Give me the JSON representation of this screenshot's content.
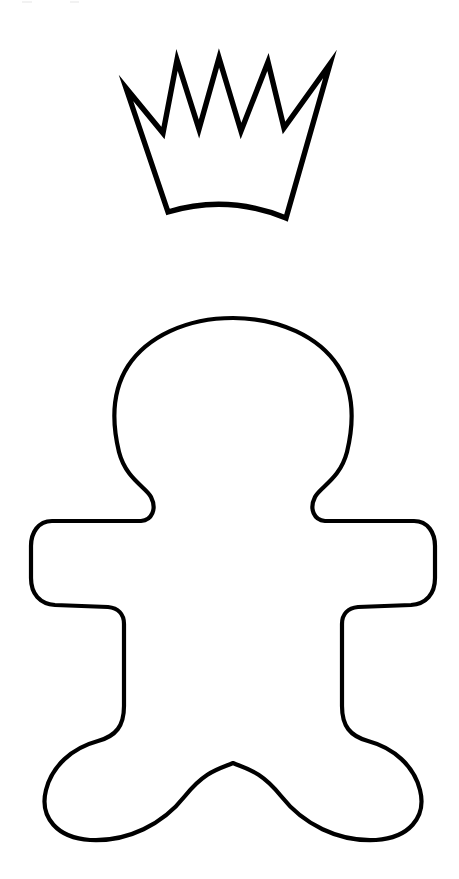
{
  "page": {
    "background_color": "#ffffff",
    "ink_color": "#000000",
    "width": 459,
    "height": 879
  },
  "artwork": {
    "crown": {
      "name": "crown",
      "label": "Crown outline",
      "point_count": 5,
      "stroke_width": 5.4,
      "bounds": {
        "x": 125,
        "y": 58,
        "width": 206,
        "height": 162
      },
      "peaks": [
        {
          "x": 126,
          "y": 88
        },
        {
          "x": 177,
          "y": 60
        },
        {
          "x": 219,
          "y": 58
        },
        {
          "x": 268,
          "y": 62
        },
        {
          "x": 330,
          "y": 64
        }
      ],
      "valleys": [
        {
          "x": 163,
          "y": 133
        },
        {
          "x": 199,
          "y": 129
        },
        {
          "x": 241,
          "y": 131
        },
        {
          "x": 284,
          "y": 128
        }
      ],
      "base_left": {
        "x": 168,
        "y": 212
      },
      "base_right": {
        "x": 286,
        "y": 218
      },
      "base_curve_dip": {
        "x": 227,
        "y": 205
      },
      "path": "M 126 88 L 163 133 L 177 60 L 199 129 L 219 58 L 241 131 L 268 62 L 284 128 L 330 64 L 286 218 Q 227 194 168 212 Z"
    },
    "gingerbread_man": {
      "name": "gingerbread-man",
      "label": "Gingerbread man outline",
      "stroke_width": 4.2,
      "bounds": {
        "x": 31,
        "y": 318,
        "width": 405,
        "height": 524
      },
      "parts": [
        {
          "name": "head",
          "top_y": 320,
          "left_x": 115,
          "right_x": 352,
          "center_x": 233
        },
        {
          "name": "neck-left",
          "x": 150,
          "y": 487
        },
        {
          "name": "neck-right",
          "x": 317,
          "y": 487
        },
        {
          "name": "left-arm",
          "tip_x": 31,
          "top_y": 522,
          "bottom_y": 602
        },
        {
          "name": "right-arm",
          "tip_x": 435,
          "top_y": 522,
          "bottom_y": 602
        },
        {
          "name": "left-armpit",
          "x": 124,
          "y": 609
        },
        {
          "name": "right-armpit",
          "x": 343,
          "y": 609
        },
        {
          "name": "crotch",
          "x": 233,
          "y": 763
        },
        {
          "name": "left-foot",
          "left_x": 45,
          "right_x": 178,
          "bottom_y": 841
        },
        {
          "name": "right-foot",
          "left_x": 289,
          "right_x": 421,
          "bottom_y": 841
        }
      ],
      "path": "M 233 318 C 186 318 147 337 128 366 C 112 391 112 423 119 452 C 126 479 146 487 151 497 C 157 509 152 520 141 521 L 52 521 C 38 521 31 533 31 546 L 31 578 C 31 594 40 604 55 605 L 108 607 C 118 608 124 614 124 624 L 124 706 C 124 726 116 736 98 741 C 72 748 52 766 46 790 C 39 818 58 838 90 840 C 128 842 163 824 185 796 C 205 771 219 769 233 763 C 247 769 261 771 281 796 C 303 824 338 842 376 840 C 408 838 427 818 420 790 C 414 766 394 748 368 741 C 350 736 342 726 342 706 L 342 624 C 342 614 348 608 358 607 L 411 605 C 426 604 435 594 435 578 L 435 546 C 435 533 428 521 414 521 L 325 521 C 314 520 309 509 315 497 C 320 487 340 479 347 452 C 354 423 354 391 338 366 C 319 337 280 318 233 318 Z"
    }
  }
}
